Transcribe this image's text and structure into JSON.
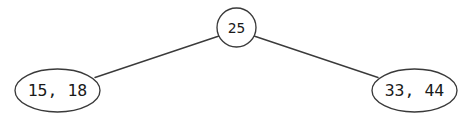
{
  "diagram": {
    "type": "tree",
    "background_color": "#ffffff",
    "stroke_color": "#3a3a3a",
    "text_color": "#1a1a1a",
    "nodes": [
      {
        "id": "root",
        "shape": "circle",
        "label": "25",
        "keys": [
          25
        ],
        "cx": 236.5,
        "cy": 27.5,
        "rx": 19.5,
        "ry": 19.5
      },
      {
        "id": "left-leaf",
        "shape": "ellipse",
        "label": "15, 18",
        "keys": [
          15,
          18
        ],
        "cx": 57.5,
        "cy": 90.5,
        "rx": 42.5,
        "ry": 21.5
      },
      {
        "id": "right-leaf",
        "shape": "ellipse",
        "label": "33, 44",
        "keys": [
          33,
          44
        ],
        "cx": 414.5,
        "cy": 90.5,
        "rx": 42.5,
        "ry": 21.5
      }
    ],
    "edges": [
      {
        "id": "root-to-left",
        "from": "root",
        "to": "left-leaf",
        "x1": 219.0,
        "y1": 36.0,
        "x2": 95.0,
        "y2": 77.5
      },
      {
        "id": "root-to-right",
        "from": "root",
        "to": "right-leaf",
        "x1": 254.0,
        "y1": 36.0,
        "x2": 378.0,
        "y2": 77.5
      }
    ]
  }
}
